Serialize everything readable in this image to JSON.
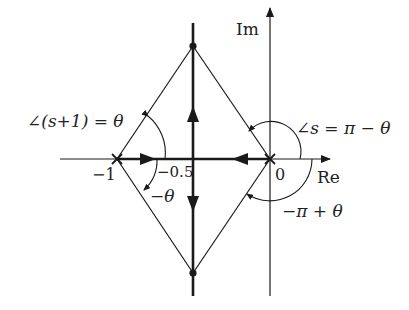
{
  "diagram": {
    "type": "root-locus",
    "axes": {
      "real_label": "Re",
      "imag_label": "Im"
    },
    "ticks": {
      "minus_one": "−1",
      "minus_half": "−0.5",
      "zero": "0"
    },
    "poles": [
      {
        "name": "pole-minus-one",
        "value": "-1",
        "marker": "x"
      },
      {
        "name": "pole-zero",
        "value": "0",
        "marker": "x"
      }
    ],
    "breakaway_point": "-0.5",
    "annotations": {
      "angle_s_plus_1": "∠(s+1) = θ",
      "minus_theta": "−θ",
      "angle_s": "∠s = π − θ",
      "minus_pi_plus_theta": "−π + θ"
    },
    "colors": {
      "stroke": "#1a1a1a",
      "background": "#ffffff"
    }
  }
}
